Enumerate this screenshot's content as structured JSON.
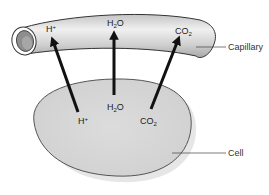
{
  "diagram": {
    "colors": {
      "background": "#ffffff",
      "capillary_fill": "#d4d4d4",
      "capillary_highlight": "#eeeeee",
      "capillary_outline": "#333333",
      "capillary_lumen": "#8a8a8a",
      "cell_fill": "#d8d8d8",
      "cell_outline": "#555555",
      "arrow": "#111111",
      "label_text": "#222222"
    },
    "structures": [
      {
        "id": "capillary",
        "label": "Capillary"
      },
      {
        "id": "cell",
        "label": "Cell"
      }
    ],
    "molecules_in_capillary": [
      {
        "base": "H",
        "sup": "+",
        "sub": ""
      },
      {
        "base": "H",
        "sub": "2",
        "tail": "O",
        "sup": ""
      },
      {
        "base": "CO",
        "sub": "2",
        "sup": ""
      }
    ],
    "molecules_in_cell": [
      {
        "base": "H",
        "sup": "+",
        "sub": ""
      },
      {
        "base": "H",
        "sub": "2",
        "tail": "O",
        "sup": ""
      },
      {
        "base": "CO",
        "sub": "2",
        "sup": ""
      }
    ],
    "arrows": [
      {
        "from": "cell H+",
        "to": "capillary H+",
        "direction": "cell-to-capillary"
      },
      {
        "from": "cell H2O",
        "to": "capillary H2O",
        "direction": "cell-to-capillary"
      },
      {
        "from": "cell CO2",
        "to": "capillary CO2",
        "direction": "cell-to-capillary"
      }
    ]
  }
}
